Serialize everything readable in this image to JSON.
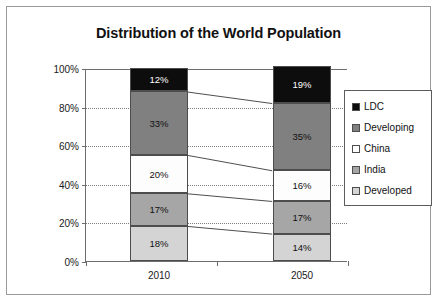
{
  "chart_data": {
    "type": "bar",
    "title": "Distribution of the World Population",
    "xlabel": "",
    "ylabel": "",
    "categories": [
      "2010",
      "2050"
    ],
    "ylim": [
      0,
      100
    ],
    "ytick_labels": [
      "0%",
      "20%",
      "40%",
      "60%",
      "80%",
      "100%"
    ],
    "ytick_values": [
      0,
      20,
      40,
      60,
      80,
      100
    ],
    "grid": true,
    "grid_style": "dotted-horizontal",
    "stacked": true,
    "legend_position": "right",
    "series": [
      {
        "name": "LDC",
        "color": "#0d0d0d",
        "text_color": "#ffffff",
        "values": [
          12,
          19
        ],
        "labels": [
          "12%",
          "19%"
        ]
      },
      {
        "name": "Developing",
        "color": "#808080",
        "text_color": "#111111",
        "values": [
          33,
          35
        ],
        "labels": [
          "33%",
          "35%"
        ]
      },
      {
        "name": "China",
        "color": "#fdfdfd",
        "text_color": "#111111",
        "values": [
          20,
          16
        ],
        "labels": [
          "20%",
          "16%"
        ]
      },
      {
        "name": "India",
        "color": "#a6a6a6",
        "text_color": "#111111",
        "values": [
          17,
          17
        ],
        "labels": [
          "17%",
          "17%"
        ]
      },
      {
        "name": "Developed",
        "color": "#d4d4d4",
        "text_color": "#111111",
        "values": [
          18,
          14
        ],
        "labels": [
          "18%",
          "14%"
        ]
      }
    ],
    "legend_entries": [
      {
        "label": "LDC",
        "color": "#0d0d0d"
      },
      {
        "label": "Developing",
        "color": "#808080"
      },
      {
        "label": "China",
        "color": "#fdfdfd"
      },
      {
        "label": "India",
        "color": "#a6a6a6"
      },
      {
        "label": "Developed",
        "color": "#d4d4d4"
      }
    ],
    "connector_lines": true
  }
}
